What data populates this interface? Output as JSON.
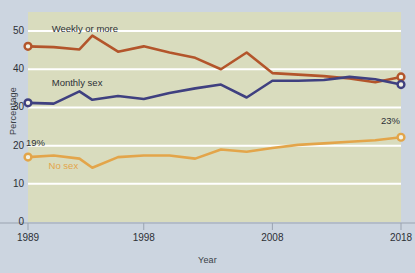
{
  "chart_data": {
    "type": "line",
    "title": "",
    "xlabel": "Year",
    "ylabel": "Percentage",
    "xlim": [
      1989,
      2018
    ],
    "ylim": [
      0,
      55
    ],
    "ytick_values": [
      0,
      10,
      20,
      30,
      40,
      50
    ],
    "ytick_labels": [
      "0",
      "10",
      "20",
      "30",
      "40",
      "50"
    ],
    "xtick_values": [
      1989,
      1998,
      2008,
      2018
    ],
    "xtick_labels": [
      "1989",
      "1998",
      "2008",
      "2018"
    ],
    "grid": "horizontal",
    "legend_position": "inline-labels",
    "x": [
      1989,
      1991,
      1993,
      1994,
      1996,
      1998,
      2000,
      2002,
      2004,
      2006,
      2008,
      2010,
      2012,
      2014,
      2016,
      2018
    ],
    "series": [
      {
        "name": "Weekly or more",
        "color": "#b3552b",
        "marker_years": [
          1989,
          2018
        ],
        "values": [
          46,
          45.8,
          45.2,
          48.8,
          44.6,
          46,
          44.4,
          43,
          40,
          44.4,
          39,
          38.6,
          38.2,
          37.6,
          36.6,
          38
        ]
      },
      {
        "name": "Monthly sex",
        "color": "#3f4080",
        "marker_years": [
          1989,
          2018
        ],
        "values": [
          31.2,
          31,
          34.2,
          32,
          33,
          32.2,
          33.8,
          35,
          36,
          32.6,
          37,
          37,
          37.2,
          38,
          37.4,
          36
        ]
      },
      {
        "name": "No sex",
        "color": "#e3a54a",
        "marker_years": [
          1989,
          2018
        ],
        "values": [
          17,
          17.4,
          16.6,
          14.2,
          17,
          17.4,
          17.4,
          16.6,
          19,
          18.4,
          19.4,
          20.2,
          20.6,
          21,
          21.4,
          22.2
        ]
      }
    ],
    "annotations": [
      {
        "name": "weekly-or-more-label",
        "text": "Weekly or more",
        "color": "#2c3036"
      },
      {
        "name": "monthly-sex-label",
        "text": "Monthly sex",
        "color": "#2c3036"
      },
      {
        "name": "no-sex-label",
        "text": "No sex",
        "color": "#e3a54a"
      },
      {
        "name": "start-value-label",
        "text": "19%",
        "color": "#2c3036"
      },
      {
        "name": "end-value-label",
        "text": "23%",
        "color": "#2c3036"
      }
    ],
    "colors": {
      "page_background": "#ccd5e0",
      "plot_background": "#d9dcbe",
      "gridline": "#ffffff",
      "axis": "#9aa3b0",
      "text": "#2c3036"
    }
  }
}
